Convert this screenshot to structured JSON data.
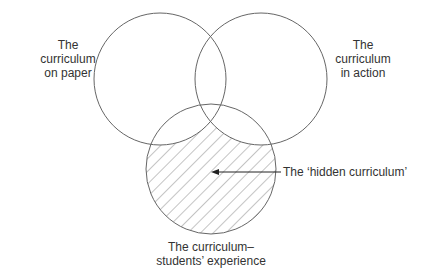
{
  "diagram": {
    "type": "venn",
    "circles": [
      {
        "id": "paper",
        "label_lines": [
          "The",
          "curriculum",
          "on paper"
        ],
        "cx": 160,
        "cy": 79,
        "r": 66,
        "hatched": false
      },
      {
        "id": "action",
        "label_lines": [
          "The",
          "curriculum",
          "in action"
        ],
        "cx": 261,
        "cy": 79,
        "r": 66,
        "hatched": false
      },
      {
        "id": "students",
        "label_lines": [
          "The curriculum–",
          "students’ experience"
        ],
        "cx": 211,
        "cy": 169,
        "r": 65,
        "hatched": true
      }
    ],
    "annotation": {
      "text": "The ‘hidden curriculum’",
      "arrow_from": [
        281,
        172
      ],
      "arrow_to": [
        211,
        172
      ]
    },
    "colors": {
      "stroke": "#666666",
      "hatch": "#8a8a8a",
      "text": "#333333",
      "background": "#ffffff"
    }
  }
}
